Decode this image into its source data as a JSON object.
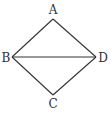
{
  "diagram": {
    "type": "quadrilateral",
    "stroke_color": "#333333",
    "background": "#ffffff",
    "vertices": [
      {
        "name": "A",
        "x": 53,
        "y": 19,
        "label_x": 53,
        "label_y": 14
      },
      {
        "name": "B",
        "x": 12,
        "y": 57,
        "label_x": 6,
        "label_y": 62
      },
      {
        "name": "C",
        "x": 53,
        "y": 95,
        "label_x": 53,
        "label_y": 108
      },
      {
        "name": "D",
        "x": 96,
        "y": 57,
        "label_x": 102,
        "label_y": 62
      }
    ],
    "edges": [
      [
        "A",
        "B"
      ],
      [
        "B",
        "C"
      ],
      [
        "C",
        "D"
      ],
      [
        "D",
        "A"
      ],
      [
        "B",
        "D"
      ]
    ],
    "labels": {
      "A": "A",
      "B": "B",
      "C": "C",
      "D": "D"
    }
  }
}
